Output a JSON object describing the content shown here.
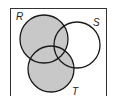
{
  "diagram": {
    "type": "venn",
    "sets": [
      {
        "label": "R",
        "shaded": true
      },
      {
        "label": "S",
        "shaded": false
      },
      {
        "label": "T",
        "shaded": true
      }
    ],
    "shaded_region": "R ∪ T",
    "colors": {
      "shade": "#c8c8c8",
      "stroke": "#1a1a1a",
      "background": "#ffffff"
    }
  }
}
